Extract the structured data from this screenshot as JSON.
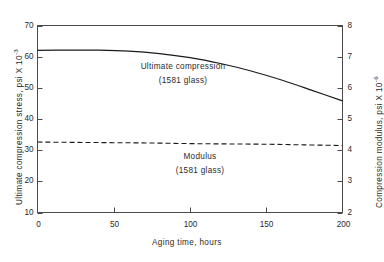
{
  "chart_data": {
    "type": "line",
    "title": "",
    "xlabel": "Aging time, hours",
    "ylabel_left": "Ultimate compression stress, psi X 10",
    "ylabel_left_exponent": "-3",
    "ylabel_right": "Compression modulus, psi X 10",
    "ylabel_right_exponent": "-6",
    "xlim": [
      0,
      200
    ],
    "ylim_left": [
      10,
      70
    ],
    "ylim_right": [
      2,
      8
    ],
    "xticks": [
      "0",
      "50",
      "100",
      "150",
      "200"
    ],
    "xtick_values": [
      0,
      50,
      100,
      150,
      200
    ],
    "yticks_left": [
      "70",
      "60",
      "50",
      "40",
      "30",
      "20",
      "10"
    ],
    "ytick_values_left": [
      70,
      60,
      50,
      40,
      30,
      20,
      10
    ],
    "yticks_right": [
      "8",
      "7",
      "6",
      "5",
      "4",
      "3",
      "2"
    ],
    "ytick_values_right": [
      8,
      7,
      6,
      5,
      4,
      3,
      2
    ],
    "grid": false,
    "legend_position": "inline-annotations",
    "series": [
      {
        "name": "Ultimate compression",
        "annotation": "Ultimate compression",
        "annotation_sub": "(1581 glass)",
        "axis": "left",
        "style": "solid",
        "color": "#1a1a1a",
        "x": [
          0,
          20,
          40,
          60,
          80,
          100,
          120,
          140,
          160,
          180,
          200
        ],
        "values": [
          62.0,
          62.1,
          62.1,
          61.8,
          61.0,
          59.7,
          57.8,
          55.4,
          52.5,
          49.2,
          45.8
        ]
      },
      {
        "name": "Modulus",
        "annotation": "Modulus",
        "annotation_sub": "(1581 glass)",
        "axis": "left",
        "style": "dashed",
        "color": "#1a1a1a",
        "x": [
          0,
          25,
          50,
          75,
          100,
          125,
          150,
          175,
          200
        ],
        "values": [
          32.6,
          32.5,
          32.4,
          32.3,
          32.1,
          32.0,
          31.9,
          31.7,
          31.5
        ]
      }
    ]
  }
}
